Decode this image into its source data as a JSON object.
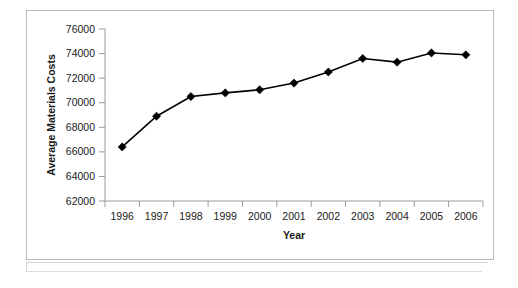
{
  "chart_data": {
    "type": "line",
    "title": "",
    "subtitle": "",
    "xlabel": "Year",
    "ylabel": "Average Materials Costs",
    "categories": [
      "1996",
      "1997",
      "1998",
      "1999",
      "2000",
      "2001",
      "2002",
      "2003",
      "2004",
      "2005",
      "2006"
    ],
    "values": [
      66400,
      68900,
      70500,
      70800,
      71050,
      71600,
      72500,
      73600,
      73300,
      74050,
      73900
    ],
    "series": [
      {
        "name": "Average Materials Costs",
        "values": [
          66400,
          68900,
          70500,
          70800,
          71050,
          71600,
          72500,
          73600,
          73300,
          74050,
          73900
        ]
      }
    ],
    "x": [
      1996,
      1997,
      1998,
      1999,
      2000,
      2001,
      2002,
      2003,
      2004,
      2005,
      2006
    ],
    "ylim": [
      62000,
      76000
    ],
    "ytick_labels": [
      "62000",
      "64000",
      "66000",
      "68000",
      "70000",
      "72000",
      "74000",
      "76000"
    ],
    "ytick_values": [
      62000,
      64000,
      66000,
      68000,
      70000,
      72000,
      74000,
      76000
    ],
    "xtick_labels": [
      "1996",
      "1997",
      "1998",
      "1999",
      "2000",
      "2001",
      "2002",
      "2003",
      "2004",
      "2005",
      "2006"
    ],
    "grid": false,
    "legend": false,
    "legend_position": "none",
    "marker": "diamond",
    "line_color": "#000000",
    "marker_color": "#000000",
    "axis_color": "#808080",
    "plot_background": "#ffffff",
    "annotations": []
  },
  "figure": {
    "border_color": "#b9b9b9",
    "background": "#ffffff"
  }
}
